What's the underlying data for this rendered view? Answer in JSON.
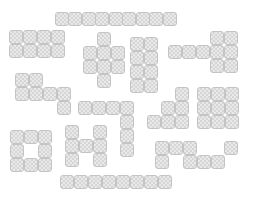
{
  "board": {
    "width": 255,
    "height": 202,
    "background": "#ffffff",
    "tile_fill": "#e9e9e9",
    "tile_border": "#c4c4c4",
    "pieces": [
      {
        "name": "top-bar",
        "tiles": [
          [
            55,
            12
          ],
          [
            68,
            12
          ],
          [
            82,
            12
          ],
          [
            95,
            12
          ],
          [
            109,
            12
          ],
          [
            122,
            12
          ],
          [
            136,
            12
          ],
          [
            149,
            12
          ],
          [
            163,
            12
          ]
        ]
      },
      {
        "name": "rect-2x4",
        "tiles": [
          [
            9,
            30
          ],
          [
            23,
            30
          ],
          [
            37,
            30
          ],
          [
            51,
            30
          ],
          [
            9,
            44
          ],
          [
            23,
            44
          ],
          [
            37,
            44
          ],
          [
            51,
            44
          ]
        ]
      },
      {
        "name": "plus-shape",
        "tiles": [
          [
            97,
            32
          ],
          [
            83,
            46
          ],
          [
            97,
            46
          ],
          [
            111,
            46
          ],
          [
            83,
            60
          ],
          [
            97,
            60
          ],
          [
            111,
            60
          ],
          [
            97,
            74
          ]
        ]
      },
      {
        "name": "column-pair",
        "tiles": [
          [
            130,
            37
          ],
          [
            144,
            37
          ],
          [
            130,
            51
          ],
          [
            144,
            51
          ],
          [
            130,
            65
          ],
          [
            144,
            65
          ],
          [
            130,
            79
          ],
          [
            144,
            79
          ]
        ]
      },
      {
        "name": "t-shape",
        "tiles": [
          [
            168,
            45
          ],
          [
            182,
            45
          ],
          [
            196,
            45
          ],
          [
            210,
            31
          ],
          [
            224,
            31
          ],
          [
            210,
            45
          ],
          [
            224,
            45
          ],
          [
            210,
            59
          ],
          [
            224,
            59
          ]
        ]
      },
      {
        "name": "l-shape",
        "tiles": [
          [
            15,
            73
          ],
          [
            29,
            73
          ],
          [
            15,
            87
          ],
          [
            29,
            87
          ],
          [
            43,
            87
          ],
          [
            57,
            87
          ],
          [
            57,
            101
          ]
        ]
      },
      {
        "name": "hook-shape",
        "tiles": [
          [
            78,
            101
          ],
          [
            92,
            101
          ],
          [
            106,
            101
          ],
          [
            120,
            101
          ],
          [
            120,
            115
          ],
          [
            120,
            129
          ],
          [
            120,
            143
          ]
        ]
      },
      {
        "name": "h-shape",
        "tiles": [
          [
            65,
            125
          ],
          [
            65,
            139
          ],
          [
            65,
            153
          ],
          [
            79,
            139
          ],
          [
            93,
            125
          ],
          [
            93,
            139
          ],
          [
            93,
            153
          ]
        ]
      },
      {
        "name": "ring-square",
        "tiles": [
          [
            10,
            130
          ],
          [
            24,
            130
          ],
          [
            38,
            130
          ],
          [
            10,
            144
          ],
          [
            38,
            144
          ],
          [
            10,
            158
          ],
          [
            24,
            158
          ],
          [
            38,
            158
          ]
        ]
      },
      {
        "name": "stair-shape",
        "tiles": [
          [
            175,
            87
          ],
          [
            161,
            101
          ],
          [
            175,
            101
          ],
          [
            147,
            115
          ],
          [
            161,
            115
          ],
          [
            175,
            115
          ]
        ]
      },
      {
        "name": "block-3x3",
        "tiles": [
          [
            197,
            87
          ],
          [
            211,
            87
          ],
          [
            225,
            87
          ],
          [
            197,
            101
          ],
          [
            211,
            101
          ],
          [
            225,
            101
          ],
          [
            197,
            115
          ],
          [
            211,
            115
          ],
          [
            225,
            115
          ]
        ]
      },
      {
        "name": "zigzag-shape",
        "tiles": [
          [
            155,
            141
          ],
          [
            169,
            141
          ],
          [
            183,
            141
          ],
          [
            224,
            141
          ],
          [
            155,
            155
          ],
          [
            183,
            155
          ],
          [
            197,
            155
          ],
          [
            211,
            155
          ]
        ]
      },
      {
        "name": "bottom-bar",
        "tiles": [
          [
            60,
            175
          ],
          [
            74,
            175
          ],
          [
            88,
            175
          ],
          [
            102,
            175
          ],
          [
            116,
            175
          ],
          [
            130,
            175
          ],
          [
            144,
            175
          ],
          [
            158,
            175
          ]
        ]
      }
    ]
  }
}
